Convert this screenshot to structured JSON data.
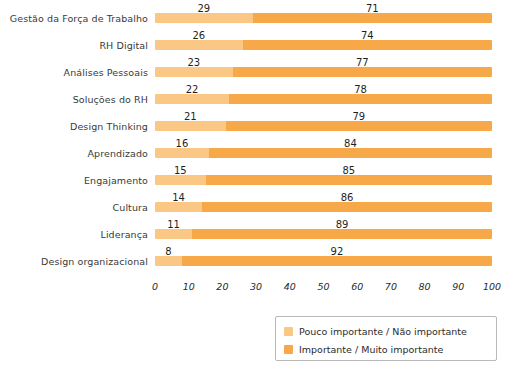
{
  "chart_data": {
    "type": "bar",
    "orientation": "horizontal",
    "stacked": true,
    "title": "",
    "xlabel": "",
    "ylabel": "",
    "xlim": [
      0,
      100
    ],
    "xticks": [
      "0",
      "10",
      "20",
      "30",
      "40",
      "50",
      "60",
      "70",
      "80",
      "90",
      "100"
    ],
    "grid": false,
    "legend_position": "bottom-right",
    "categories": [
      "Gestão da Força de Trabalho",
      "RH Digital",
      "Análises Pessoais",
      "Soluções do RH",
      "Design Thinking",
      "Aprendizado",
      "Engajamento",
      "Cultura",
      "Liderança",
      "Design organizacional"
    ],
    "series": [
      {
        "name": "Pouco importante / Não importante",
        "color": "#FAC884",
        "values": [
          29,
          26,
          23,
          22,
          21,
          16,
          15,
          14,
          11,
          8
        ]
      },
      {
        "name": "Importante / Muito importante",
        "color": "#F7A94A",
        "values": [
          71,
          74,
          77,
          78,
          79,
          84,
          85,
          86,
          89,
          92
        ]
      }
    ]
  },
  "legend": {
    "items": [
      {
        "label": "Pouco importante / Não importante",
        "swatch": "low"
      },
      {
        "label": "Importante / Muito importante",
        "swatch": "high"
      }
    ]
  }
}
